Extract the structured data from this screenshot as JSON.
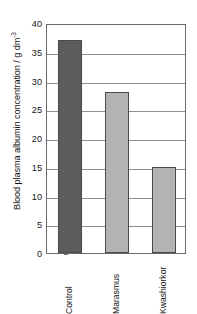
{
  "chart_data": {
    "type": "bar",
    "title": "",
    "xlabel": "",
    "ylabel": "Blood plasma albumin concentration / g dm",
    "ylabel_exponent": "-3",
    "ylabel_full": "Blood plasma albumin concentration / g dm-3",
    "categories": [
      "Control",
      "Marasmus",
      "Kwashiorkor"
    ],
    "values": [
      37,
      28,
      15
    ],
    "series": [
      {
        "name": "Blood plasma albumin concentration",
        "values": [
          37,
          28,
          15
        ]
      }
    ],
    "bar_colors": [
      "#5c5c5c",
      "#b3b3b3",
      "#b3b3b3"
    ],
    "ylim": [
      0,
      40
    ],
    "yticks": [
      0,
      5,
      10,
      15,
      20,
      25,
      30,
      35,
      40
    ],
    "ytick_labels": [
      "0",
      "5",
      "10",
      "15",
      "20",
      "25",
      "30",
      "35",
      "40"
    ],
    "grid": true,
    "grid_axis": "y",
    "legend": false,
    "legend_position": "none",
    "frame": true,
    "xtick_label_rotation": 90,
    "units": "g dm-3"
  },
  "figure": {
    "background": "#ffffff",
    "axis_color": "#6a6a6a",
    "grid_color": "#8d8d8d",
    "text_color": "#161616"
  }
}
